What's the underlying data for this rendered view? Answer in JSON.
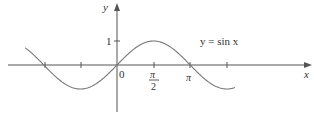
{
  "chart_data": {
    "type": "line",
    "title": "",
    "function_label": "y = sin x",
    "xlabel": "x",
    "ylabel": "y",
    "x_ticks": [
      {
        "value": -3.14159,
        "label": ""
      },
      {
        "value": -1.5708,
        "label": ""
      },
      {
        "value": 0,
        "label": "0"
      },
      {
        "value": 1.5708,
        "label": "π/2",
        "num": "π",
        "den": "2"
      },
      {
        "value": 3.14159,
        "label": "π"
      },
      {
        "value": 4.71239,
        "label": ""
      }
    ],
    "y_ticks": [
      {
        "value": 1,
        "label": "1"
      }
    ],
    "xlim": [
      -3.2,
      5.4
    ],
    "ylim": [
      -1.3,
      2.6
    ],
    "series": [
      {
        "name": "y = sin x",
        "x_range": [
          -3.94,
          5.06
        ],
        "function": "sin"
      }
    ],
    "grid": false,
    "legend": "none",
    "colors": {
      "axis": "#555555",
      "curve": "#777777",
      "text": "#333333"
    }
  },
  "labels": {
    "y_axis": "y",
    "x_axis": "x",
    "one": "1",
    "zero": "0",
    "pi_half_num": "π",
    "pi_half_den": "2",
    "pi": "π",
    "func": "y = sin x"
  }
}
